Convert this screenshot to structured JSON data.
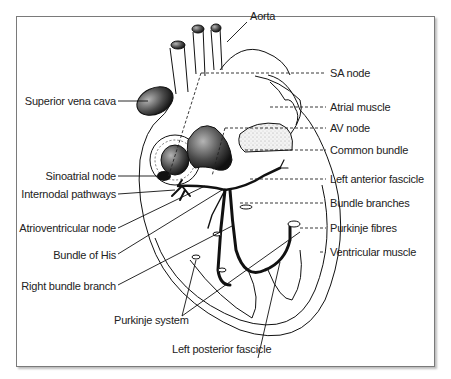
{
  "figure": {
    "labels_left": [
      {
        "id": "superior-vena-cava",
        "text": "Superior vena cava"
      },
      {
        "id": "sinoatrial-node",
        "text": "Sinoatrial node"
      },
      {
        "id": "internodal-pathways",
        "text": "Internodal pathways"
      },
      {
        "id": "atrioventricular-node",
        "text": "Atrioventricular node"
      },
      {
        "id": "bundle-of-his",
        "text": "Bundle of His"
      },
      {
        "id": "right-bundle-branch",
        "text": "Right bundle branch"
      }
    ],
    "labels_right": [
      {
        "id": "sa-node",
        "text": "SA node"
      },
      {
        "id": "atrial-muscle",
        "text": "Atrial muscle"
      },
      {
        "id": "av-node",
        "text": "AV node"
      },
      {
        "id": "common-bundle",
        "text": "Common bundle"
      },
      {
        "id": "left-anterior-fascicle",
        "text": "Left anterior fascicle"
      },
      {
        "id": "bundle-branches",
        "text": "Bundle branches"
      },
      {
        "id": "purkinje-fibres",
        "text": "Purkinje fibres"
      },
      {
        "id": "ventricular-muscle",
        "text": "Ventricular muscle"
      }
    ],
    "labels_other": {
      "aorta": "Aorta",
      "purkinje_system": "Purkinje system",
      "left_posterior_fascicle": "Left posterior fascicle"
    },
    "colors": {
      "line": "#111111",
      "frame": "#7a7a7a",
      "shade_dark": "#2a2a2a",
      "shade_mid": "#8a8a8a",
      "stipple": "#e6e6e6"
    }
  }
}
